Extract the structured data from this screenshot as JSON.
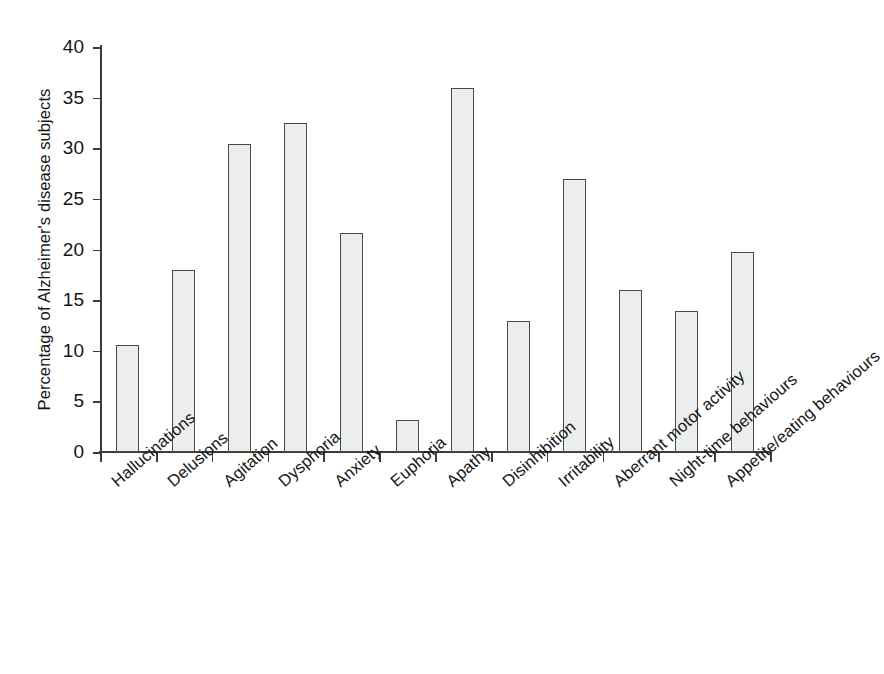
{
  "chart_data": {
    "type": "bar",
    "title": "",
    "xlabel": "",
    "ylabel": "Percentage of Alzheimer's disease subjects",
    "ylim": [
      0,
      40
    ],
    "yticks": [
      0,
      5,
      10,
      15,
      20,
      25,
      30,
      35,
      40
    ],
    "grid": false,
    "legend": null,
    "bar_fill_color": "#eceded",
    "bar_edge_color": "#4a4a4a",
    "axis_color": "#3c3c3c",
    "categories": [
      "Hallucinations",
      "Delusions",
      "Agitation",
      "Dysphoria",
      "Anxiety",
      "Euphoria",
      "Apathy",
      "Disinhibition",
      "Irritability",
      "Aberrant motor activity",
      "Night-time behaviours",
      "Appetite/eating behaviours"
    ],
    "values": [
      10.6,
      18.0,
      30.4,
      32.5,
      21.6,
      3.2,
      36.0,
      12.9,
      27.0,
      16.0,
      13.9,
      19.8
    ]
  }
}
